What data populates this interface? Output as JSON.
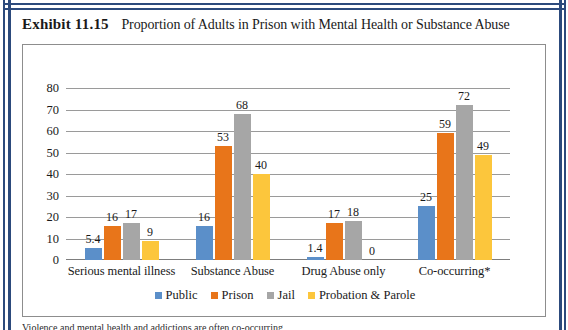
{
  "exhibit": {
    "label": "Exhibit 11.15",
    "caption": "Proportion of Adults in Prison with Mental Health or Substance Abuse"
  },
  "footnote": {
    "text": "Violence and mental health and addictions are often co-occurring"
  },
  "colors": {
    "public": "#5B8FC9",
    "prison": "#E8751A",
    "jail": "#A6A6A6",
    "probation": "#FCC63C",
    "frame_blue": "#2c4a7c",
    "gridline": "#9a9a9a",
    "box_border": "#8d8d8d"
  },
  "chart_data": {
    "type": "bar",
    "title": "Proportion of Adults in Prison with Mental Health or Substance Abuse",
    "xlabel": "",
    "ylabel": "",
    "ylim": [
      0,
      80
    ],
    "yticks": [
      80,
      70,
      60,
      50,
      40,
      30,
      20,
      10,
      0
    ],
    "grid": true,
    "legend_position": "bottom",
    "categories": [
      "Serious mental illness",
      "Substance Abuse",
      "Drug Abuse only",
      "Co-occurring*"
    ],
    "series": [
      {
        "name": "Public",
        "color": "#5B8FC9",
        "values": [
          5.4,
          16,
          1.4,
          25
        ],
        "labels": [
          "5.4",
          "16",
          "1.4",
          "25"
        ]
      },
      {
        "name": "Prison",
        "color": "#E8751A",
        "values": [
          16,
          53,
          17,
          59
        ],
        "labels": [
          "16",
          "53",
          "17",
          "59"
        ]
      },
      {
        "name": "Jail",
        "color": "#A6A6A6",
        "values": [
          17,
          68,
          18,
          72
        ],
        "labels": [
          "17",
          "68",
          "18",
          "72"
        ]
      },
      {
        "name": "Probation & Parole",
        "color": "#FCC63C",
        "values": [
          9,
          40,
          0,
          49
        ],
        "labels": [
          "9",
          "40",
          "0",
          "49"
        ]
      }
    ]
  }
}
